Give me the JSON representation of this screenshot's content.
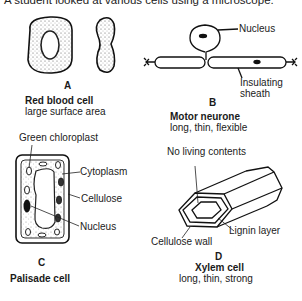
{
  "caption": "A student looked at various cells using a microscope.",
  "cells": [
    {
      "letter": "A",
      "name": "Red blood cell",
      "description": "large surface area",
      "labels": []
    },
    {
      "letter": "B",
      "name": "Motor neurone",
      "description": "long, thin, flexible",
      "labels": [
        "Nucleus",
        "Insulating",
        "sheath"
      ]
    },
    {
      "letter": "C",
      "name": "Palisade cell",
      "description": "",
      "labels": [
        "Green chloroplast",
        "Cytoplasm",
        "Cellulose",
        "Nucleus"
      ]
    },
    {
      "letter": "D",
      "name": "Xylem cell",
      "description": "long, thin, strong",
      "labels": [
        "No living contents",
        "Lignin layer",
        "Cellulose wall"
      ]
    }
  ]
}
